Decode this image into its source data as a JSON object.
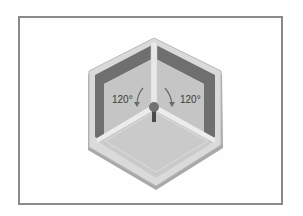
{
  "figure": {
    "labels": {
      "left_angle": "120°",
      "right_angle": "120°"
    },
    "colors": {
      "frame_border": "#8a8a8a",
      "rim_light": "#d8d8d8",
      "rim_edge": "#b5b5b5",
      "back_wall_dark": "#6e6e6e",
      "side_wall_left": "#c4c4c4",
      "side_wall_right": "#c4c4c4",
      "floor": "#cbcbcb",
      "post": "#e6e6e6",
      "knob": "#707070",
      "stem": "#4a4a4a",
      "arrow": "#6a6a6a",
      "text": "#3a3a3a"
    }
  }
}
